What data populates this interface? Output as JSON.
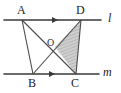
{
  "figure": {
    "kind": "geometry-diagram",
    "width": 121,
    "height": 93,
    "background_color": "#ffffff",
    "stroke_color": "#3a3a3a",
    "label_color": "#1b1b1b",
    "shade_fill_color": "#c8c8c8",
    "shade_hatch_color": "#9a9a9a"
  },
  "lines": [
    {
      "name": "line-l",
      "label": "l",
      "label_x": 108,
      "label_y": 13,
      "y": 20,
      "x_start": 4,
      "x_end": 101,
      "tick_x": 55,
      "tick_direction": "right"
    },
    {
      "name": "line-m",
      "label": "m",
      "label_x": 104,
      "label_y": 66,
      "y": 74,
      "x_start": 4,
      "x_end": 99,
      "tick_x": 52,
      "tick_direction": "right"
    }
  ],
  "points": [
    {
      "name": "A",
      "label": "A",
      "x": 22,
      "y": 20,
      "label_x": 17,
      "label_y": 4
    },
    {
      "name": "D",
      "label": "D",
      "x": 81,
      "y": 20,
      "label_x": 76,
      "label_y": 4
    },
    {
      "name": "B",
      "label": "B",
      "x": 33,
      "y": 74,
      "label_x": 28,
      "label_y": 77
    },
    {
      "name": "C",
      "label": "C",
      "x": 76,
      "y": 74,
      "label_x": 71,
      "label_y": 77
    },
    {
      "name": "O",
      "label": "O",
      "x": 55,
      "y": 47,
      "label_x": 47,
      "label_y": 39
    }
  ],
  "segments": [
    {
      "name": "segment-AB",
      "from": "A",
      "to": "B"
    },
    {
      "name": "segment-AC",
      "from": "A",
      "to": "C"
    },
    {
      "name": "segment-BD",
      "from": "B",
      "to": "D"
    },
    {
      "name": "segment-DC",
      "from": "D",
      "to": "C"
    }
  ],
  "shaded_region": {
    "name": "triangle-OCD",
    "vertices": [
      "O",
      "C",
      "D"
    ],
    "fill": "#c8c8c8",
    "hatch": "#9a9a9a"
  }
}
